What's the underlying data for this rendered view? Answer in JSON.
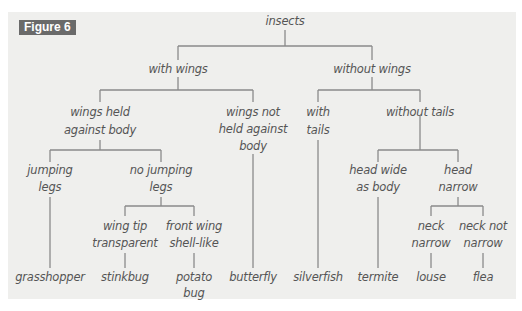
{
  "figure_label": "Figure 6",
  "colors": {
    "panel_bg": "#efefed",
    "line": "#8a8a8a",
    "badge_bg": "#6a6a6a",
    "text": "#555555"
  },
  "tree": {
    "root": "insects",
    "n_with_wings": "with wings",
    "n_without_wings": "without wings",
    "n_wings_held_1": "wings held",
    "n_wings_held_2": "against body",
    "n_wings_not_1": "wings not",
    "n_wings_not_2": "held against",
    "n_wings_not_3": "body",
    "n_with_tails_1": "with",
    "n_with_tails_2": "tails",
    "n_without_tails": "without tails",
    "n_jumping_1": "jumping",
    "n_jumping_2": "legs",
    "n_no_jumping_1": "no jumping",
    "n_no_jumping_2": "legs",
    "n_head_wide_1": "head wide",
    "n_head_wide_2": "as body",
    "n_head_narrow_1": "head",
    "n_head_narrow_2": "narrow",
    "n_wing_tip_1": "wing tip",
    "n_wing_tip_2": "transparent",
    "n_front_wing_1": "front wing",
    "n_front_wing_2": "shell-like",
    "n_neck_narrow_1": "neck",
    "n_neck_narrow_2": "narrow",
    "n_neck_not_1": "neck not",
    "n_neck_not_2": "narrow",
    "leaves": [
      "grasshopper",
      "stinkbug",
      "potato",
      "bug",
      "butterfly",
      "silverfish",
      "termite",
      "louse",
      "flea"
    ]
  }
}
